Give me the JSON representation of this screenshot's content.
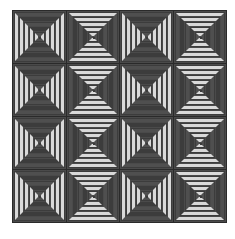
{
  "image": {
    "description": "Log cabin courthouse-steps quilt pattern, 4x4 grid of blocks",
    "rows": 4,
    "cols": 4,
    "layout": [
      [
        "A",
        "B",
        "A",
        "B"
      ],
      [
        "A",
        "B",
        "A",
        "B"
      ],
      [
        "A",
        "B",
        "A",
        "B"
      ],
      [
        "A",
        "B",
        "A",
        "B"
      ]
    ],
    "block_types": {
      "A": "light strips on left/right sides, dark strips on top/bottom",
      "B": "light strips on top/bottom, dark strips on left/right sides"
    },
    "rings": 5,
    "colors": {
      "dark": "#4f4f4f",
      "dark_alt": "#3c3c3c",
      "light": "#d9d9d9",
      "grid_line": "#2a2a2a",
      "background": "#ffffff"
    }
  }
}
